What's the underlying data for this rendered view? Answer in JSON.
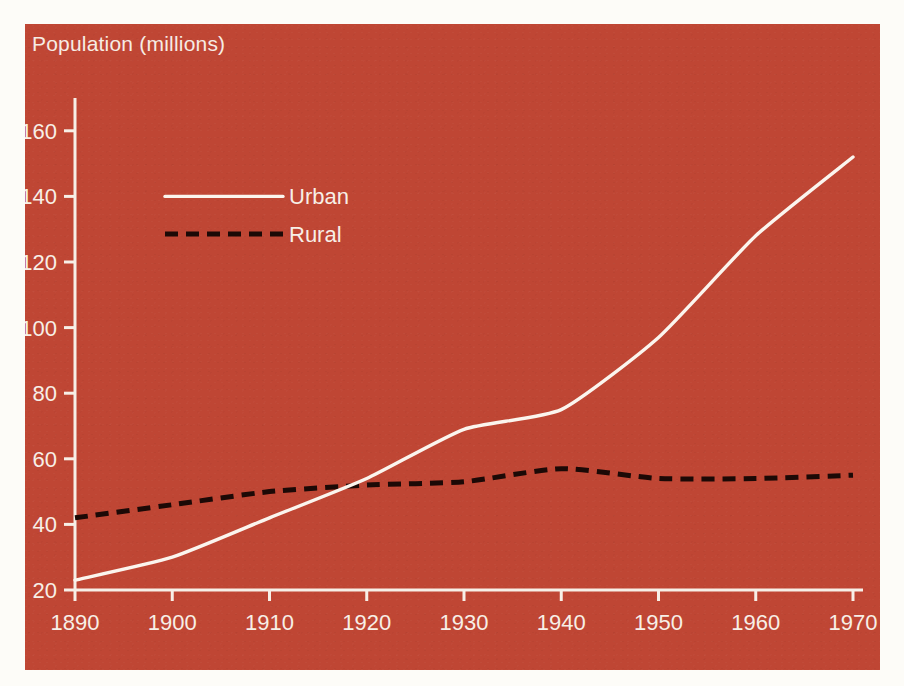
{
  "panel": {
    "background_color": "#bf4634",
    "page_background_color": "#fdfcf8"
  },
  "axis_title": "Population (millions)",
  "legend": {
    "position": "inside-top-left",
    "entries": [
      {
        "label": "Urban",
        "style": "solid",
        "color": "#fbf5ee"
      },
      {
        "label": "Rural",
        "style": "dashed",
        "color": "#1c0906"
      }
    ]
  },
  "chart_data": {
    "type": "line",
    "title": "Population (millions)",
    "subtitle": "",
    "xlabel": "",
    "ylabel": "Population (millions)",
    "x": [
      1890,
      1900,
      1910,
      1920,
      1930,
      1940,
      1950,
      1960,
      1970
    ],
    "xlim": [
      1890,
      1970
    ],
    "ylim": [
      20,
      170
    ],
    "yticks": [
      20,
      40,
      60,
      80,
      100,
      120,
      140,
      160
    ],
    "ytick_labels": [
      "20",
      "40",
      "60",
      "80",
      "100",
      "120",
      "140",
      "160"
    ],
    "xticks": [
      1890,
      1900,
      1910,
      1920,
      1930,
      1940,
      1950,
      1960,
      1970
    ],
    "xtick_labels": [
      "1890",
      "1900",
      "1910",
      "1920",
      "1930",
      "1940",
      "1950",
      "1960",
      "1970"
    ],
    "grid": false,
    "legend_position": "upper left",
    "series": [
      {
        "name": "Urban",
        "style": "solid",
        "color": "#fbf5ee",
        "values": [
          23,
          30,
          42,
          54,
          69,
          75,
          97,
          128,
          152
        ]
      },
      {
        "name": "Rural",
        "style": "dashed",
        "color": "#1c0906",
        "values": [
          42,
          46,
          50,
          52,
          53,
          57,
          54,
          54,
          55
        ]
      }
    ],
    "annotations": [
      "Urban line crosses above Rural line near 1918",
      "Rural series peaks at 1940",
      "Urban growth accelerates sharply after 1940"
    ]
  }
}
